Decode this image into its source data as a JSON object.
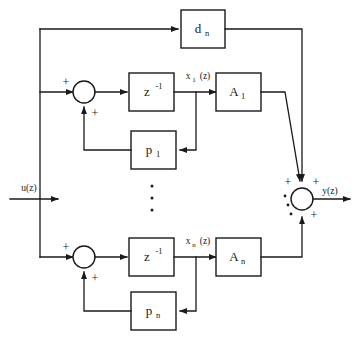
{
  "figure": {
    "type": "signal-flow-block-diagram",
    "domain": "discrete-time state-space / parallel modal realization",
    "background_color": "#ffffff",
    "line_color": "#1a1a1a"
  },
  "signals": {
    "input": {
      "label": "u(z)",
      "name": "input-signal-uz"
    },
    "output": {
      "label": "y(z)",
      "name": "output-signal-yz"
    },
    "state_1": {
      "label": "x",
      "subscript": "1",
      "suffix": "(z)",
      "full": "x1(z)"
    },
    "state_n": {
      "label": "x",
      "subscript": "n",
      "suffix": "(z)",
      "full": "xn(z)"
    }
  },
  "blocks": [
    {
      "id": "feedthrough",
      "name": "block-d-n",
      "base": "d",
      "subscript": "n",
      "superscript": "",
      "full_label": "d_n",
      "row": "top"
    },
    {
      "id": "delay-1",
      "name": "block-delay-row1",
      "base": "z",
      "subscript": "",
      "superscript": "-1",
      "full_label": "z^-1",
      "row": "1"
    },
    {
      "id": "gain-A1",
      "name": "block-A-1",
      "base": "A",
      "subscript": "1",
      "superscript": "",
      "full_label": "A_1",
      "row": "1"
    },
    {
      "id": "feedback-p1",
      "name": "block-p-1",
      "base": "p",
      "subscript": "1",
      "superscript": "",
      "full_label": "p_1",
      "row": "1"
    },
    {
      "id": "delay-n",
      "name": "block-delay-rown",
      "base": "z",
      "subscript": "",
      "superscript": "-1",
      "full_label": "z^-1",
      "row": "n"
    },
    {
      "id": "gain-An",
      "name": "block-A-n",
      "base": "A",
      "subscript": "n",
      "superscript": "",
      "full_label": "A_n",
      "row": "n"
    },
    {
      "id": "feedback-pn",
      "name": "block-p-n",
      "base": "p",
      "subscript": "n",
      "superscript": "",
      "full_label": "p_n",
      "row": "n"
    }
  ],
  "summing_junctions": [
    {
      "id": "sum-row1",
      "name": "summing-junction-row1",
      "signs": [
        "+",
        "+"
      ],
      "sign_positions": [
        "left-top",
        "bottom-right"
      ]
    },
    {
      "id": "sum-rown",
      "name": "summing-junction-rown",
      "signs": [
        "+",
        "+"
      ],
      "sign_positions": [
        "left-top",
        "bottom-right"
      ]
    },
    {
      "id": "sum-output",
      "name": "summing-junction-output",
      "signs": [
        "+",
        "+",
        "+"
      ],
      "sign_positions": [
        "top-left",
        "top-right",
        "bottom-right"
      ]
    }
  ],
  "ellipses": [
    {
      "id": "rows-ellipsis",
      "name": "vertical-ellipsis-rows",
      "glyph": "vertical-dots",
      "count": 3
    },
    {
      "id": "output-ellipsis",
      "name": "vertical-ellipsis-output",
      "glyph": "vertical-dots",
      "count": 3
    }
  ],
  "plus_labels": {
    "plus": "+"
  }
}
